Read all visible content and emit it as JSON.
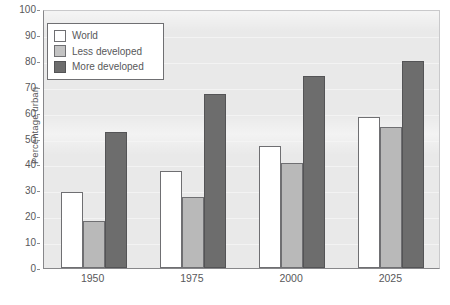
{
  "chart_data": {
    "type": "bar",
    "title": "",
    "subtitle": "",
    "xlabel": "",
    "ylabel": "Percentage urban",
    "categories": [
      "1950",
      "1975",
      "2000",
      "2025"
    ],
    "series": [
      {
        "name": "World",
        "values": [
          29.5,
          37.5,
          47.0,
          58.5
        ],
        "color": "#ffffff"
      },
      {
        "name": "Less developed",
        "values": [
          18.0,
          27.5,
          40.5,
          54.5
        ],
        "color": "#b9b9b9"
      },
      {
        "name": "More developed",
        "values": [
          52.5,
          67.0,
          74.0,
          80.0
        ],
        "color": "#6d6d6d"
      }
    ],
    "ylim": [
      0,
      100
    ],
    "y_ticks": [
      0,
      10,
      20,
      30,
      40,
      50,
      60,
      70,
      80,
      90,
      100
    ],
    "y_tick_labels": [
      "0",
      "10",
      "20",
      "30",
      "40",
      "50",
      "60",
      "70",
      "80",
      "90",
      "100"
    ],
    "grid": true,
    "grid_axis": "y",
    "legend_position": "upper left",
    "legend_entries": [
      "World",
      "Less developed",
      "More developed"
    ]
  },
  "axes": {
    "y_title": "Percentage urban"
  },
  "legend": {
    "items": [
      {
        "label": "World",
        "swatch": "swatch-white"
      },
      {
        "label": "Less developed",
        "swatch": "swatch-light-gray"
      },
      {
        "label": "More developed",
        "swatch": "swatch-dark-gray"
      }
    ]
  },
  "caption": {
    "text": ""
  },
  "colors": {
    "plot_background": "#e9e9e9",
    "axis_line": "#87878a",
    "text": "#58585a",
    "bar_world": "#ffffff",
    "bar_less_developed": "#b9b9b9",
    "bar_more_developed": "#6d6d6d",
    "bar_outline": "#6f6f72"
  }
}
